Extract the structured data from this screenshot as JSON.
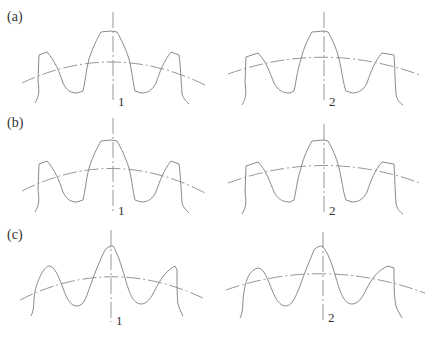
{
  "figure": {
    "rows": [
      {
        "label": "(a)",
        "profile": "standard involute (trapezoidal teeth, flat tips)",
        "panels": [
          {
            "id": "1",
            "label": "1"
          },
          {
            "id": "2",
            "label": "2"
          }
        ]
      },
      {
        "label": "(b)",
        "profile": "modified involute (narrower flat tips)",
        "panels": [
          {
            "id": "1",
            "label": "1"
          },
          {
            "id": "2",
            "label": "2"
          }
        ]
      },
      {
        "label": "(c)",
        "profile": "rounded/pointed teeth (near-sinusoidal)",
        "panels": [
          {
            "id": "1",
            "label": "1"
          },
          {
            "id": "2",
            "label": "2"
          }
        ]
      }
    ],
    "colors": {
      "line": "#8a8a8a",
      "text": "#333333",
      "background": "#ffffff"
    }
  }
}
